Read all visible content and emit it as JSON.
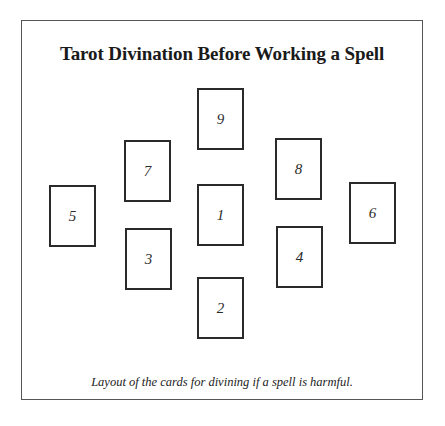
{
  "diagram": {
    "title": "Tarot Divination Before Working a Spell",
    "caption": "Layout of the cards for divining if a spell is harmful.",
    "cards": [
      {
        "label": "1",
        "x": 197,
        "y": 184
      },
      {
        "label": "2",
        "x": 197,
        "y": 277
      },
      {
        "label": "3",
        "x": 125,
        "y": 228
      },
      {
        "label": "4",
        "x": 276,
        "y": 226
      },
      {
        "label": "5",
        "x": 49,
        "y": 185
      },
      {
        "label": "6",
        "x": 349,
        "y": 182
      },
      {
        "label": "7",
        "x": 124,
        "y": 140
      },
      {
        "label": "8",
        "x": 275,
        "y": 138
      },
      {
        "label": "9",
        "x": 197,
        "y": 88
      }
    ]
  }
}
